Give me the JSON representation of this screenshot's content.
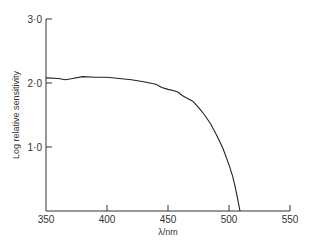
{
  "chart_data": {
    "type": "line",
    "title": "",
    "xlabel": "λ/nm",
    "ylabel": "Log relative sensitivity",
    "xlim": [
      350,
      550
    ],
    "ylim": [
      0,
      3.0
    ],
    "xticks": [
      350,
      400,
      450,
      500,
      550
    ],
    "xtick_labels": [
      "350",
      "400",
      "450",
      "500",
      "550"
    ],
    "yticks": [
      1.0,
      2.0,
      3.0
    ],
    "ytick_labels": [
      "1·0",
      "2·0",
      "3·0"
    ],
    "grid": false,
    "series": [
      {
        "name": "sensitivity",
        "x": [
          350,
          360,
          366,
          372,
          380,
          390,
          400,
          410,
          420,
          430,
          440,
          445,
          450,
          455,
          458,
          462,
          466,
          470,
          475,
          480,
          485,
          490,
          495,
          500,
          503,
          505,
          507,
          509
        ],
        "y": [
          2.08,
          2.07,
          2.05,
          2.07,
          2.1,
          2.09,
          2.09,
          2.07,
          2.05,
          2.02,
          1.98,
          1.93,
          1.9,
          1.88,
          1.86,
          1.8,
          1.76,
          1.72,
          1.62,
          1.5,
          1.36,
          1.18,
          0.98,
          0.72,
          0.54,
          0.38,
          0.2,
          0.0
        ]
      }
    ]
  }
}
